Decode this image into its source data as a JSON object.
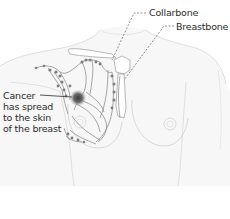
{
  "diagram": {
    "colors": {
      "outline": "#cfcfcf",
      "fill": "#f6f6f6",
      "lymph": "#8a8a8a",
      "node": "#7d7d7d",
      "tumor": "#5a5a5a",
      "leader": "#555555",
      "text": "#2b2b2b"
    },
    "labels": {
      "collarbone": "Collarbone",
      "breastbone": "Breastbone",
      "cancer": {
        "line1": "Cancer",
        "line2": "has spread",
        "line3": "to the skin",
        "line4": "of the breast"
      }
    }
  }
}
